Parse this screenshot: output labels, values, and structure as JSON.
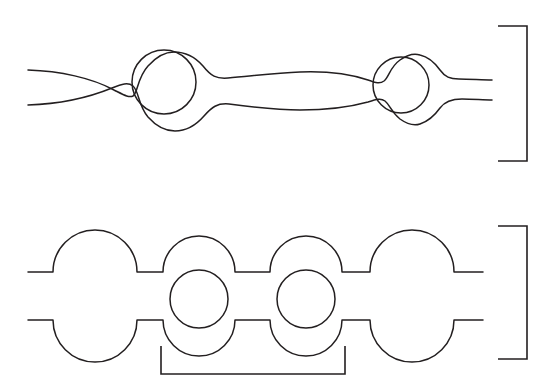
{
  "figure": {
    "background_color": "#ffffff",
    "stroke_color": "#231f20",
    "stroke_width": 1.5,
    "canvas": {
      "width": 553,
      "height": 381
    },
    "panels": [
      {
        "id": "top-panel",
        "name": "smooth-constriction-channel",
        "description": "Two smooth wavy walls forming a channel with two circular pores inscribed at the widened regions",
        "wall_lines": 2,
        "pore_count": 2,
        "channel_left_x": 28,
        "channel_right_x": 492,
        "upper_wall_left_y": 72,
        "lower_wall_left_y": 105,
        "upper_wall_right_y": 80,
        "lower_wall_right_y": 100,
        "pores": [
          {
            "label": "pore-1",
            "cx": 164,
            "cy": 82,
            "r": 32
          },
          {
            "label": "pore-2",
            "cx": 401,
            "cy": 85,
            "r": 28
          }
        ],
        "bracket": {
          "label": "right-bracket-top",
          "orientation": "right",
          "x_stem": 527,
          "x_tip": 498,
          "y_top": 26,
          "y_bottom": 161
        }
      },
      {
        "id": "bottom-panel",
        "name": "scalloped-bump-channel",
        "description": "Two scalloped walls made of semicircular bumps with two circular pores between the central bumps",
        "wall_lines": 2,
        "pore_count": 2,
        "bump_count_per_wall": 4,
        "channel_left_x": 28,
        "channel_right_x": 483,
        "upper_wall_y": 272,
        "lower_wall_y": 320,
        "bumps": [
          {
            "label": "bump-1",
            "cx": 95,
            "r": 42
          },
          {
            "label": "bump-2",
            "cx": 199,
            "r": 36
          },
          {
            "label": "bump-3",
            "cx": 306,
            "r": 36
          },
          {
            "label": "bump-4",
            "cx": 412,
            "r": 42
          }
        ],
        "pores": [
          {
            "label": "pore-1",
            "cx": 199,
            "cy": 299,
            "r": 29
          },
          {
            "label": "pore-2",
            "cx": 306,
            "cy": 299,
            "r": 29
          }
        ],
        "bracket_right": {
          "label": "right-bracket-bottom",
          "orientation": "right",
          "x_stem": 527,
          "x_tip": 498,
          "y_top": 226,
          "y_bottom": 359
        },
        "bracket_bottom": {
          "label": "bottom-bracket-unit-cell",
          "orientation": "bottom",
          "x_left": 161,
          "x_right": 345,
          "y_stem": 374,
          "y_tip": 346
        }
      }
    ]
  }
}
